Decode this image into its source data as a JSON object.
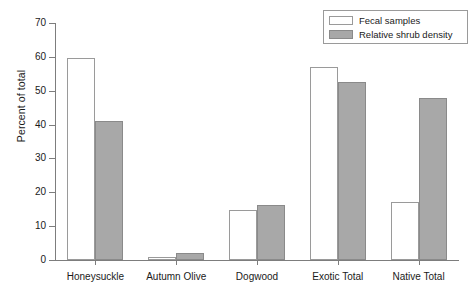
{
  "chart_data": {
    "type": "bar",
    "title": "",
    "xlabel": "",
    "ylabel": "Percent of total",
    "ylim": [
      0,
      70
    ],
    "yticks": [
      0,
      10,
      20,
      30,
      40,
      50,
      60,
      70
    ],
    "grid": false,
    "legend_position": "top-right",
    "categories": [
      "Honeysuckle",
      "Autumn Olive",
      "Dogwood",
      "Exotic Total",
      "Native Total"
    ],
    "series": [
      {
        "name": "Fecal samples",
        "color": "#ffffff",
        "values": [
          59.8,
          0.8,
          14.8,
          57.0,
          17.0
        ]
      },
      {
        "name": "Relative shrub density",
        "color": "#a8a8a8",
        "values": [
          41.0,
          2.0,
          16.2,
          52.5,
          48.0
        ]
      }
    ]
  },
  "legend": {
    "items": [
      {
        "label": "Fecal samples",
        "swatch": "open-square-icon"
      },
      {
        "label": "Relative shrub density",
        "swatch": "filled-square-icon"
      }
    ]
  },
  "axis": {
    "y_label": "Percent of total",
    "y_tick_labels": [
      "0",
      "10",
      "20",
      "30",
      "40",
      "50",
      "60",
      "70"
    ],
    "x_tick_labels": [
      "Honeysuckle",
      "Autumn Olive",
      "Dogwood",
      "Exotic Total",
      "Native Total"
    ]
  },
  "colors": {
    "axis": "#7d7d7d",
    "bar_open": "#ffffff",
    "bar_fill": "#a8a8a8",
    "bar_stroke": "#9a9a9a",
    "text": "#1a1a1a",
    "background": "#ffffff"
  }
}
